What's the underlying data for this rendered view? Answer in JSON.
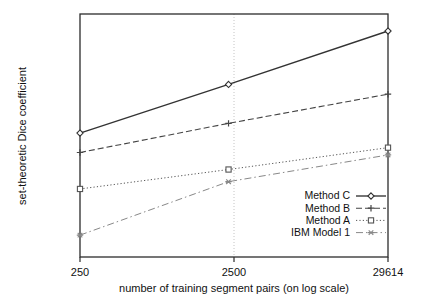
{
  "chart_data": {
    "type": "line",
    "title": "",
    "subtitle": "",
    "xlabel": "number of training segment pairs (on log scale)",
    "ylabel": "set-theoretic Dice coefficient",
    "x": [
      250,
      2500,
      29614
    ],
    "xtick_labels": [
      "250",
      "2500",
      "29614"
    ],
    "ytick_labels": [],
    "xscale": "log",
    "xlim": [
      250,
      29614
    ],
    "ylim": [
      0,
      1
    ],
    "grid": "vertical-gridline-at-2500",
    "legend_position": "lower-right-inside",
    "series": [
      {
        "name": "Method C",
        "values": [
          0.51,
          0.71,
          0.93
        ],
        "linestyle": "solid",
        "marker": "diamond",
        "color": "#333333"
      },
      {
        "name": "Method B",
        "values": [
          0.43,
          0.55,
          0.67
        ],
        "linestyle": "dashed",
        "marker": "plus",
        "color": "#444444"
      },
      {
        "name": "Method A",
        "values": [
          0.28,
          0.36,
          0.45
        ],
        "linestyle": "dotted",
        "marker": "square",
        "color": "#555555"
      },
      {
        "name": "IBM Model 1",
        "values": [
          0.09,
          0.31,
          0.42
        ],
        "linestyle": "dash-dot",
        "marker": "asterisk",
        "color": "#888888"
      }
    ]
  },
  "axes": {
    "x_tick_0": "250",
    "x_tick_1": "2500",
    "x_tick_2": "29614",
    "x_axis_label": "number of training segment pairs (on log scale)",
    "y_axis_label": "set-theoretic Dice coefficient"
  },
  "legend": {
    "items": [
      {
        "label": "Method C"
      },
      {
        "label": "Method B"
      },
      {
        "label": "Method A"
      },
      {
        "label": "IBM Model 1"
      }
    ]
  },
  "colors": {
    "frame": "#2b2b2b",
    "gridline": "#b9b9b9",
    "background": "#ffffff",
    "text": "#111111"
  }
}
